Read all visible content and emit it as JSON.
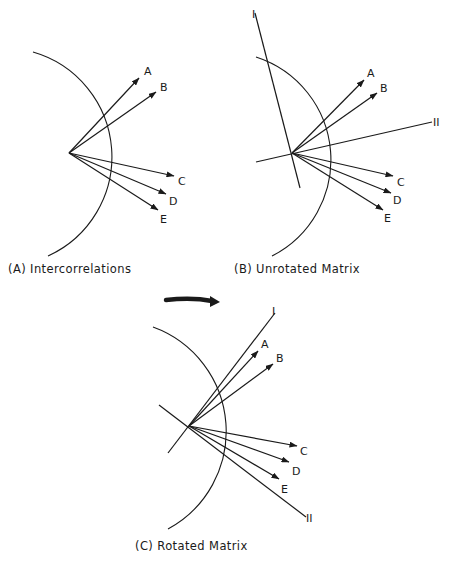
{
  "figure": {
    "panels": [
      {
        "id": "A",
        "caption": "(A) Intercorrelations",
        "origin": [
          69,
          153
        ],
        "arc": {
          "start": [
            33,
            52
          ],
          "end": [
            48,
            256
          ],
          "radius": 109
        },
        "vectors": [
          {
            "label": "A",
            "tip": [
              139,
              78
            ],
            "label_pos": [
              144,
              75
            ]
          },
          {
            "label": "B",
            "tip": [
              156,
              92
            ],
            "label_pos": [
              160,
              91
            ]
          },
          {
            "label": "C",
            "tip": [
              174,
              176
            ],
            "label_pos": [
              178,
              185
            ]
          },
          {
            "label": "D",
            "tip": [
              166,
              194
            ],
            "label_pos": [
              169,
              205
            ]
          },
          {
            "label": "E",
            "tip": [
              158,
              210
            ],
            "label_pos": [
              160,
              223
            ]
          }
        ],
        "axes": []
      },
      {
        "id": "B",
        "caption": "(B) Unrotated Matrix",
        "origin": [
          292,
          153
        ],
        "arc": {
          "start": [
            256,
            57
          ],
          "end": [
            272,
            256
          ],
          "radius": 108
        },
        "vectors": [
          {
            "label": "A",
            "tip": [
              364,
              80
            ],
            "label_pos": [
              367,
              77
            ]
          },
          {
            "label": "B",
            "tip": [
              377,
              93
            ],
            "label_pos": [
              380,
              92
            ]
          },
          {
            "label": "C",
            "tip": [
              393,
              176
            ],
            "label_pos": [
              397,
              186
            ]
          },
          {
            "label": "D",
            "tip": [
              391,
              193
            ],
            "label_pos": [
              393,
              204
            ]
          },
          {
            "label": "E",
            "tip": [
              383,
              210
            ],
            "label_pos": [
              384,
              222
            ]
          }
        ],
        "axes": [
          {
            "label": "I",
            "from": [
              300,
              188
            ],
            "to": [
              255,
              13
            ],
            "label_pos": [
              252,
              18
            ]
          },
          {
            "label": "II",
            "from": [
              256,
              162
            ],
            "to": [
              432,
              122
            ],
            "label_pos": [
              433,
              126
            ]
          }
        ]
      },
      {
        "id": "C",
        "caption": "(C) Rotated Matrix",
        "origin": [
          189,
          426
        ],
        "arc": {
          "start": [
            153,
            327
          ],
          "end": [
            168,
            529
          ],
          "radius": 111
        },
        "vectors": [
          {
            "label": "A",
            "tip": [
              258,
              351
            ],
            "label_pos": [
              261,
              348
            ]
          },
          {
            "label": "B",
            "tip": [
              273,
              364
            ],
            "label_pos": [
              276,
              362
            ]
          },
          {
            "label": "C",
            "tip": [
              297,
              446
            ],
            "label_pos": [
              300,
              455
            ]
          },
          {
            "label": "D",
            "tip": [
              289,
              462
            ],
            "label_pos": [
              292,
              475
            ]
          },
          {
            "label": "E",
            "tip": [
              279,
              479
            ],
            "label_pos": [
              281,
              493
            ]
          }
        ],
        "axes": [
          {
            "label": "I",
            "from": [
              168,
              453
            ],
            "to": [
              275,
              313
            ],
            "label_pos": [
              272,
              315
            ]
          },
          {
            "label": "II",
            "from": [
              159,
              405
            ],
            "to": [
              306,
              517
            ],
            "label_pos": [
              306,
              522
            ]
          }
        ]
      }
    ],
    "rotation_arrow": {
      "from": [
        166,
        300
      ],
      "to": [
        218,
        301
      ],
      "direction": "clockwise"
    },
    "colors": {
      "ink": "#1a1a1a",
      "background": "#ffffff"
    }
  }
}
